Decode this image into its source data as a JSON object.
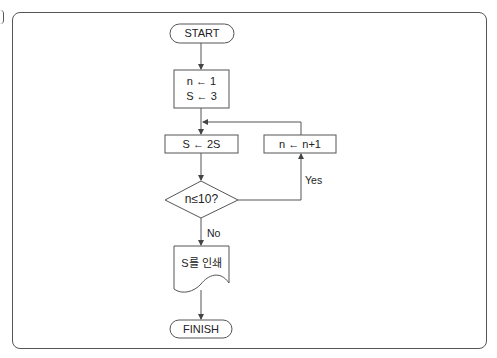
{
  "diagram": {
    "type": "flowchart",
    "nodes": {
      "start": {
        "label": "START",
        "shape": "terminator"
      },
      "init": {
        "lines": [
          "n ← 1",
          "S ← 3"
        ],
        "shape": "process"
      },
      "double": {
        "label": "S ← 2S",
        "shape": "process"
      },
      "increment": {
        "label": "n ← n+1",
        "shape": "process"
      },
      "decision": {
        "label": "n≤10?",
        "shape": "decision"
      },
      "output": {
        "label": "S를 인쇄",
        "shape": "document"
      },
      "finish": {
        "label": "FINISH",
        "shape": "terminator"
      }
    },
    "edges": {
      "yes_label": "Yes",
      "no_label": "No"
    },
    "colors": {
      "stroke": "#555555",
      "text": "#222222",
      "background": "#ffffff"
    }
  }
}
